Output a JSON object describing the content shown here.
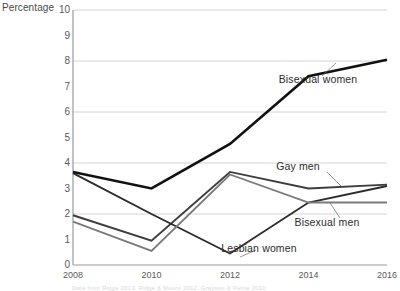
{
  "chart_data": {
    "type": "line",
    "title": "",
    "subtitle": "",
    "xlabel": "",
    "ylabel": "Percentage",
    "categories": [
      2008,
      2010,
      2012,
      2014,
      2016
    ],
    "x_tick_labels": [
      "2008",
      "2010",
      "2012",
      "2014",
      "2016"
    ],
    "y_tick_labels": [
      "0",
      "1",
      "2",
      "3",
      "4",
      "5",
      "6",
      "7",
      "8",
      "9",
      "10"
    ],
    "ylim": [
      0,
      10
    ],
    "y_ticks": [
      0,
      1,
      2,
      3,
      4,
      5,
      6,
      7,
      8,
      9,
      10
    ],
    "grid": "horizontal-major-only",
    "gridlines_at": [
      2,
      4,
      6,
      8,
      10
    ],
    "legend_position": "inline-annotations",
    "series": [
      {
        "name": "Bisexual women",
        "color": "#111111",
        "values": [
          3.65,
          3.0,
          4.75,
          7.4,
          8.05
        ]
      },
      {
        "name": "Gay men",
        "color": "#3d3d3d",
        "values": [
          1.95,
          0.95,
          3.65,
          3.0,
          3.15
        ]
      },
      {
        "name": "Lesbian women",
        "color": "#2b2b2b",
        "values": [
          3.6,
          2.0,
          0.45,
          2.45,
          3.1
        ]
      },
      {
        "name": "Bisexual men",
        "color": "#7a7a7a",
        "values": [
          1.7,
          0.55,
          3.55,
          2.45,
          2.45
        ]
      }
    ],
    "annotations": [
      {
        "series": "Bisexual women",
        "label": "Bisexual women",
        "x": 318,
        "y": 79
      },
      {
        "series": "Gay men",
        "label": "Gay men",
        "x": 298,
        "y": 166
      },
      {
        "series": "Bisexual men",
        "label": "Bisexual men",
        "x": 327,
        "y": 222
      },
      {
        "series": "Lesbian women",
        "label": "Lesbian women",
        "x": 259,
        "y": 248
      }
    ]
  },
  "footnote": {
    "text": "Data from Ridge 2013, Ridge & Moore 2012, Grayson & Petrie 2010"
  }
}
